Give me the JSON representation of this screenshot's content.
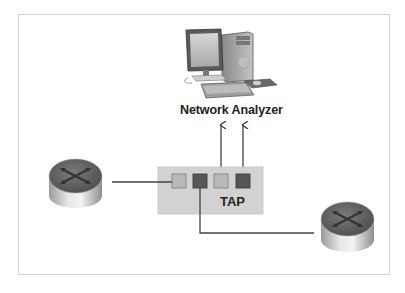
{
  "diagram": {
    "analyzer": {
      "label": "Network Analyzer",
      "icon": "desktop-computer-icon"
    },
    "tap": {
      "label": "TAP",
      "ports": [
        {
          "id": "port-1",
          "shade": "light"
        },
        {
          "id": "port-2",
          "shade": "dark"
        },
        {
          "id": "port-3",
          "shade": "light"
        },
        {
          "id": "port-4",
          "shade": "dark"
        }
      ]
    },
    "routers": [
      {
        "id": "router-left",
        "icon": "router-icon"
      },
      {
        "id": "router-right",
        "icon": "router-icon"
      }
    ],
    "connections": [
      {
        "from": "router-left",
        "to": "port-1"
      },
      {
        "from": "port-2",
        "to": "router-right"
      },
      {
        "from": "port-3",
        "to": "analyzer",
        "arrow": true
      },
      {
        "from": "port-4",
        "to": "analyzer",
        "arrow": true
      }
    ],
    "colors": {
      "tap_fill": "#d2d2d2",
      "port_light": "#b9b9b9",
      "port_dark": "#565656",
      "line": "#444444",
      "frame_border": "#d4d4d4"
    }
  }
}
